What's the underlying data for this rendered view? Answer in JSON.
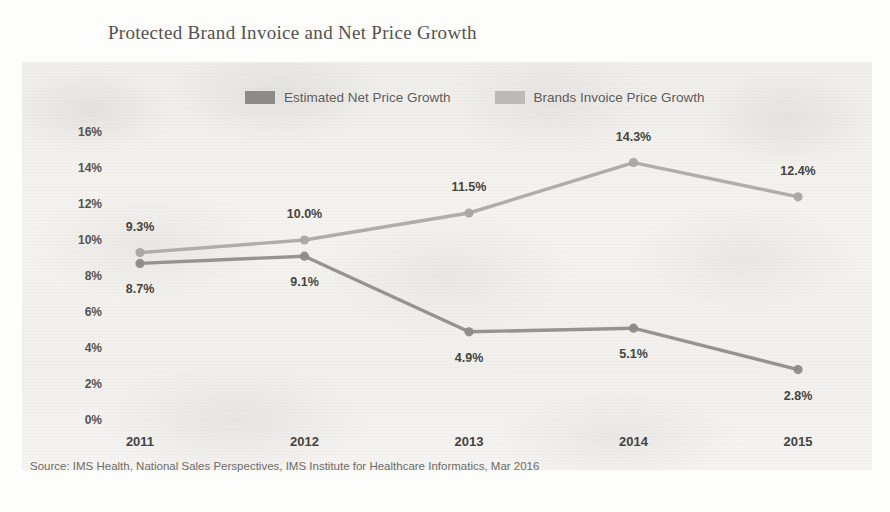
{
  "chart_data": {
    "type": "line",
    "title": "Protected Brand Invoice and Net Price Growth",
    "xlabel": "",
    "ylabel": "",
    "categories": [
      "2011",
      "2012",
      "2013",
      "2014",
      "2015"
    ],
    "ylim": [
      0,
      16
    ],
    "y_ticks": [
      "0%",
      "2%",
      "4%",
      "6%",
      "8%",
      "10%",
      "12%",
      "14%",
      "16%"
    ],
    "y_tick_values": [
      0,
      2,
      4,
      6,
      8,
      10,
      12,
      14,
      16
    ],
    "grid": false,
    "legend_position": "top-center",
    "series": [
      {
        "name": "Estimated Net Price Growth",
        "color": "#8d8b88",
        "values": [
          8.7,
          9.1,
          4.9,
          5.1,
          2.8
        ],
        "labels": [
          "8.7%",
          "9.1%",
          "4.9%",
          "5.1%",
          "2.8%"
        ],
        "label_side": "below"
      },
      {
        "name": "Brands Invoice Price Growth",
        "color": "#a9a7a3",
        "values": [
          9.3,
          10.0,
          11.5,
          14.3,
          12.4
        ],
        "labels": [
          "9.3%",
          "10.0%",
          "11.5%",
          "14.3%",
          "12.4%"
        ],
        "label_side": "above"
      }
    ],
    "source": "Source: IMS Health, National Sales Perspectives, IMS Institute for Healthcare Informatics, Mar 2016"
  },
  "legend": {
    "items": [
      {
        "label": "Estimated Net Price Growth",
        "swatch": "#8d8b88"
      },
      {
        "label": "Brands Invoice Price Growth",
        "swatch": "#bcbab6"
      }
    ]
  },
  "colors": {
    "net_line": "#8d8b88",
    "invoice_line": "#a9a7a3",
    "title_text": "#53514e",
    "tick_text": "#45433f",
    "source_text": "#6d6b67",
    "plot_background": "#f4f2ef"
  }
}
